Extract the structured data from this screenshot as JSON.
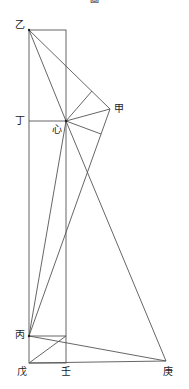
{
  "title": "圖",
  "labels": {
    "yi": "乙",
    "jia": "甲",
    "ding": "丁",
    "xin": "心",
    "bing": "丙",
    "wu": "戊",
    "ren": "壬",
    "geng": "庚"
  },
  "colors": {
    "line": "#555555",
    "text": "#222222",
    "background": "#ffffff"
  },
  "points": {
    "yi": [
      29,
      30
    ],
    "rect_top_right": [
      66,
      30
    ],
    "ding": [
      29,
      121
    ],
    "xin": [
      66,
      121
    ],
    "jia": [
      110,
      109
    ],
    "foot_on_yi_jia": [
      92,
      91
    ],
    "foot_below_jia": [
      101,
      134
    ],
    "bing": [
      29,
      336
    ],
    "ren_top": [
      66,
      336
    ],
    "wu": [
      29,
      363
    ],
    "ren": [
      66,
      363
    ],
    "geng": [
      166,
      361
    ]
  }
}
